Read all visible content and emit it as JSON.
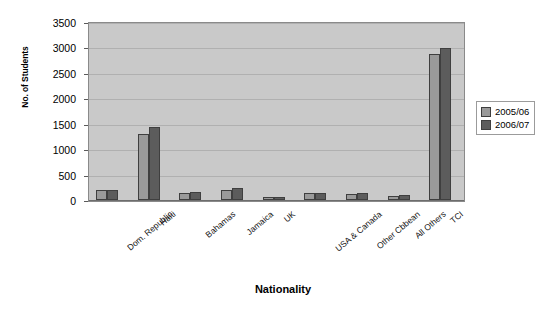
{
  "chart_data": {
    "type": "bar",
    "title": "",
    "xlabel": "Nationality",
    "ylabel": "No. of Students",
    "ylim": [
      0,
      3500
    ],
    "ytick_step": 500,
    "yticks": [
      "0",
      "500",
      "1000",
      "1500",
      "2000",
      "2500",
      "3000",
      "3500"
    ],
    "grid": true,
    "legend_position": "right",
    "categories": [
      "Dom. Republic",
      "Haiti",
      "Bahamas",
      "Jamaica",
      "UK",
      "USA & Canada",
      "Other Cbbean",
      "All Others",
      "TCI"
    ],
    "series": [
      {
        "name": "2005/06",
        "color": "#9a9a9a",
        "values": [
          200,
          1300,
          130,
          190,
          50,
          130,
          120,
          80,
          2880
        ]
      },
      {
        "name": "2006/07",
        "color": "#5c5c5c",
        "values": [
          190,
          1430,
          150,
          230,
          60,
          140,
          130,
          90,
          2990
        ]
      }
    ]
  },
  "legend": {
    "items": [
      {
        "label": "2005/06",
        "swatch": "#9a9a9a"
      },
      {
        "label": "2006/07",
        "swatch": "#5c5c5c"
      }
    ]
  },
  "axes": {
    "y_title": "No. of Students",
    "x_title": "Nationality"
  },
  "plot_colors": {
    "plot_background": "#c9c9c9",
    "gridline": "#b0b0b0",
    "plot_border": "#8a8a8a",
    "bar_outline": "#3f3f3f",
    "page_background": "#ffffff"
  }
}
